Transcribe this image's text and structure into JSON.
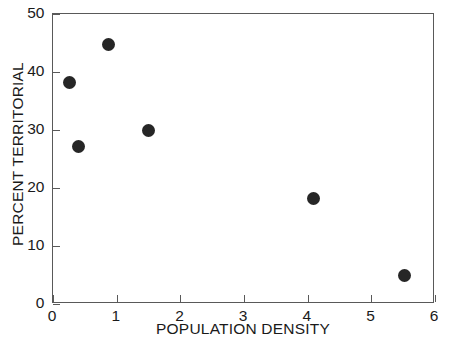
{
  "chart_data": {
    "type": "scatter",
    "title": "",
    "xlabel": "POPULATION DENSITY",
    "ylabel": "PERCENT TERRITORIAL",
    "xlim": [
      0,
      6
    ],
    "ylim": [
      0,
      50
    ],
    "xticks": [
      0,
      1,
      2,
      3,
      4,
      5,
      6
    ],
    "yticks": [
      0,
      10,
      20,
      30,
      40,
      50
    ],
    "xtick_labels": [
      "0",
      "1",
      "2",
      "3",
      "4",
      "5",
      "6"
    ],
    "ytick_labels": [
      "0",
      "10",
      "20",
      "30",
      "40",
      "50"
    ],
    "grid": false,
    "legend": null,
    "marker": {
      "shape": "circle",
      "color": "#262626",
      "size_px": 13
    },
    "frame_color": "#595959",
    "background_color": "#ffffff",
    "points": [
      {
        "x": 0.28,
        "y": 38.1
      },
      {
        "x": 0.42,
        "y": 27.0
      },
      {
        "x": 0.89,
        "y": 44.6
      },
      {
        "x": 1.51,
        "y": 29.7
      },
      {
        "x": 4.1,
        "y": 18.1
      },
      {
        "x": 5.53,
        "y": 4.8
      }
    ],
    "series": [
      {
        "name": "",
        "x": [
          0.28,
          0.42,
          0.89,
          1.51,
          4.1,
          5.53
        ],
        "values": [
          38.1,
          27.0,
          44.6,
          29.7,
          18.1,
          4.8
        ]
      }
    ]
  }
}
